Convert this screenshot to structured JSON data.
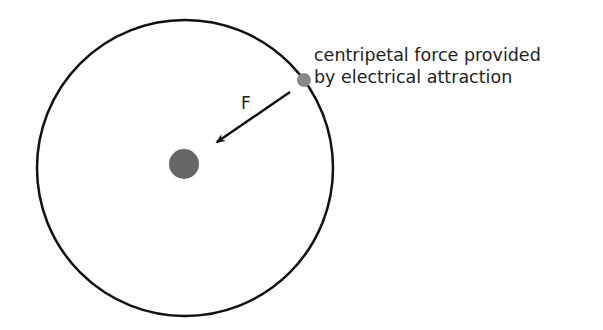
{
  "diagram": {
    "caption_line1": "centripetal force provided",
    "caption_line2": "by electrical attraction",
    "force_label": "F",
    "colors": {
      "orbit": "#111111",
      "nucleus": "#666666",
      "electron": "#888888",
      "arrow": "#111111"
    }
  }
}
